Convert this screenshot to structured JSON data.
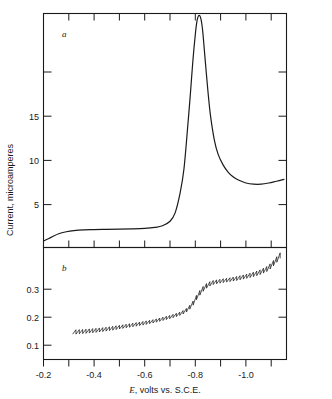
{
  "figure": {
    "panel_a_letter": "a",
    "panel_b_letter": "b",
    "ylabel": "Current, microamperes",
    "xlabel_symbol": "E",
    "xlabel_rest": ", volts vs. S.C.E."
  },
  "chart_data": [
    {
      "type": "line",
      "title": "a",
      "xlabel": "E, volts vs. S.C.E.",
      "ylabel": "Current, microamperes",
      "xlim": [
        -0.2,
        -1.16
      ],
      "ylim": [
        0,
        19.6
      ],
      "xticks": [
        -0.2,
        -0.3,
        -0.4,
        -0.5,
        -0.6,
        -0.7,
        -0.8,
        -0.9,
        -1.0,
        -1.1
      ],
      "xticklabels": [
        "",
        "",
        "",
        "",
        "",
        "",
        "",
        "",
        "",
        ""
      ],
      "yticks": [
        5,
        10,
        15
      ],
      "yticklabels": [
        "5",
        "10",
        "15"
      ],
      "grid": false,
      "legend": null,
      "annotations": [
        {
          "text": "a",
          "x": -0.25,
          "y": 18.0
        }
      ],
      "series": [
        {
          "name": "derivative polarogram",
          "x": [
            -0.2,
            -0.23,
            -0.26,
            -0.29,
            -0.32,
            -0.36,
            -0.4,
            -0.45,
            -0.5,
            -0.55,
            -0.6,
            -0.64,
            -0.67,
            -0.7,
            -0.72,
            -0.74,
            -0.755,
            -0.77,
            -0.78,
            -0.79,
            -0.8,
            -0.805,
            -0.81,
            -0.815,
            -0.82,
            -0.825,
            -0.83,
            -0.84,
            -0.85,
            -0.86,
            -0.875,
            -0.89,
            -0.91,
            -0.93,
            -0.95,
            -0.97,
            -1.0,
            -1.03,
            -1.06,
            -1.09,
            -1.12,
            -1.15
          ],
          "y": [
            0.55,
            0.85,
            1.15,
            1.32,
            1.42,
            1.48,
            1.5,
            1.52,
            1.54,
            1.56,
            1.6,
            1.68,
            1.82,
            2.2,
            2.9,
            4.6,
            6.6,
            10.2,
            12.8,
            15.6,
            17.9,
            18.8,
            19.3,
            19.45,
            19.3,
            18.8,
            17.9,
            15.4,
            13.0,
            11.0,
            9.0,
            7.8,
            6.9,
            6.3,
            5.9,
            5.65,
            5.4,
            5.3,
            5.3,
            5.4,
            5.55,
            5.7
          ]
        }
      ]
    },
    {
      "type": "line",
      "title": "b",
      "xlabel": "E, volts vs. S.C.E.",
      "ylabel": "Current, microamperes",
      "xlim": [
        -0.2,
        -1.16
      ],
      "ylim": [
        0,
        0.4
      ],
      "xticks": [
        -0.2,
        -0.3,
        -0.4,
        -0.5,
        -0.6,
        -0.7,
        -0.8,
        -0.9,
        -1.0,
        -1.1
      ],
      "xticklabels": [
        "-0.2",
        "",
        "-0.4",
        "",
        "-0.6",
        "",
        "-0.8",
        "",
        "-1.0",
        ""
      ],
      "yticks": [
        0.1,
        0.2,
        0.3
      ],
      "yticklabels": [
        "0.1",
        "0.2",
        "0.3"
      ],
      "grid": false,
      "legend": null,
      "annotations": [
        {
          "text": "b",
          "x": -0.25,
          "y": 0.345
        }
      ],
      "oscillating": true,
      "series": [
        {
          "name": "conventional polarogram (DME drop oscillations)",
          "x": [
            -0.315,
            -0.35,
            -0.39,
            -0.43,
            -0.47,
            -0.51,
            -0.55,
            -0.59,
            -0.63,
            -0.66,
            -0.69,
            -0.715,
            -0.74,
            -0.76,
            -0.775,
            -0.79,
            -0.8,
            -0.815,
            -0.83,
            -0.845,
            -0.86,
            -0.88,
            -0.9,
            -0.93,
            -0.96,
            -0.99,
            -1.02,
            -1.05,
            -1.08,
            -1.1,
            -1.12,
            -1.135
          ],
          "y": [
            0.098,
            0.1,
            0.103,
            0.107,
            0.112,
            0.118,
            0.124,
            0.13,
            0.137,
            0.144,
            0.151,
            0.158,
            0.166,
            0.177,
            0.19,
            0.208,
            0.225,
            0.243,
            0.258,
            0.268,
            0.274,
            0.278,
            0.281,
            0.285,
            0.29,
            0.296,
            0.303,
            0.312,
            0.325,
            0.342,
            0.362,
            0.378
          ],
          "oscillation_amplitude": [
            0.016,
            0.015,
            0.015,
            0.014,
            0.014,
            0.013,
            0.013,
            0.013,
            0.012,
            0.012,
            0.012,
            0.012,
            0.012,
            0.013,
            0.014,
            0.015,
            0.016,
            0.017,
            0.017,
            0.016,
            0.015,
            0.014,
            0.014,
            0.014,
            0.015,
            0.015,
            0.016,
            0.017,
            0.018,
            0.019,
            0.02,
            0.02
          ]
        }
      ]
    }
  ]
}
